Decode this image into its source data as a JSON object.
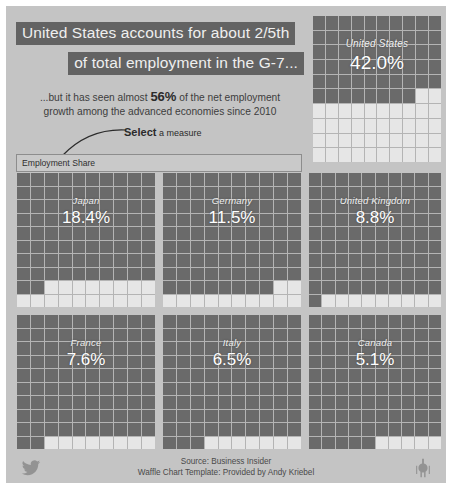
{
  "dashboard": {
    "background_color": "#c4c4c4",
    "waffle_off_color": "#6a6a6a",
    "waffle_on_color": "#e6e6e6",
    "title_highlight_color": "#636363",
    "title_text_color": "#efefef"
  },
  "header": {
    "title_line_1": "United States accounts for about 2/5th",
    "title_line_2": "of total employment in the G-7...",
    "subtitle_prefix": "...but it has seen almost ",
    "subtitle_highlight": "56%",
    "subtitle_middle": " of the net employment",
    "subtitle_line_2": "growth among the advanced economies since 2010",
    "hint_strong": "Select",
    "hint_rest": " a measure"
  },
  "measure_select": {
    "value": "Employment Share",
    "placeholder": "Employment Share",
    "options": [
      "Employment Share"
    ]
  },
  "chart_data": {
    "type": "waffle",
    "title": "United States accounts for about 2/5th of total employment in the G-7...",
    "subtitle": "...but it has seen almost 56% of the net employment growth among the advanced economies since 2010",
    "measure": "Employment Share",
    "unit": "%",
    "grid": {
      "columns": 10,
      "rows": 10,
      "cell_value": 1
    },
    "categories": [
      "United States",
      "Japan",
      "Germany",
      "United Kingdom",
      "France",
      "Italy",
      "Canada"
    ],
    "values": [
      42.0,
      18.4,
      11.5,
      8.8,
      7.6,
      6.5,
      5.1
    ],
    "panels": [
      {
        "id": "us",
        "label": "United States",
        "value": 42.0,
        "value_label": "42.0%",
        "filled_cells": 42
      },
      {
        "id": "japan",
        "label": "Japan",
        "value": 18.4,
        "value_label": "18.4%",
        "filled_cells": 18
      },
      {
        "id": "germany",
        "label": "Germany",
        "value": 11.5,
        "value_label": "11.5%",
        "filled_cells": 12
      },
      {
        "id": "uk",
        "label": "United Kingdom",
        "value": 8.8,
        "value_label": "8.8%",
        "filled_cells": 9
      },
      {
        "id": "france",
        "label": "France",
        "value": 7.6,
        "value_label": "7.6%",
        "filled_cells": 8
      },
      {
        "id": "italy",
        "label": "Italy",
        "value": 6.5,
        "value_label": "6.5%",
        "filled_cells": 7
      },
      {
        "id": "canada",
        "label": "Canada",
        "value": 5.1,
        "value_label": "5.1%",
        "filled_cells": 5
      }
    ],
    "legend": [],
    "grid_on": true
  },
  "footer": {
    "source_line": "Source: Business Insider",
    "credit_line": "Waffle Chart Template: Provided by Andy Kriebel",
    "left_icon": "twitter-icon",
    "right_icon": "tableau-icon"
  }
}
